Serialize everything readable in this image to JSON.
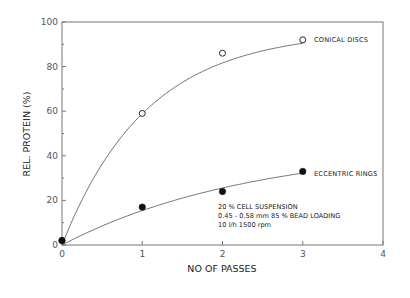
{
  "chart_data": {
    "type": "scatter",
    "title": "",
    "xlabel": "NO OF PASSES",
    "ylabel": "REL. PROTEIN (%)",
    "xlim": [
      0,
      4
    ],
    "ylim": [
      0,
      100
    ],
    "x_ticks": [
      "0",
      "1",
      "2",
      "3",
      "4"
    ],
    "y_ticks": [
      "0",
      "20",
      "40",
      "60",
      "80",
      "100"
    ],
    "grid": false,
    "legend_position": "inline labels at end of curves",
    "series": [
      {
        "name": "CONICAL DISCS",
        "marker": "open-circle",
        "x": [
          0,
          1,
          2,
          3
        ],
        "values": [
          2,
          59,
          86,
          92
        ],
        "fit": "smooth saturating curve"
      },
      {
        "name": "ECCENTRIC RINGS",
        "marker": "filled-circle",
        "x": [
          0,
          1,
          2,
          3
        ],
        "values": [
          2,
          17,
          24,
          33
        ],
        "fit": "smooth saturating curve"
      }
    ],
    "annotations": [
      "20 % CELL SUSPENSION",
      "0.45 - 0.58  mm 85 % BEAD LOADING",
      "10 l/h 1500 rpm"
    ]
  },
  "colors": {
    "line": "#666666",
    "marker": "#111111",
    "text": "#222222",
    "background": "#ffffff"
  }
}
